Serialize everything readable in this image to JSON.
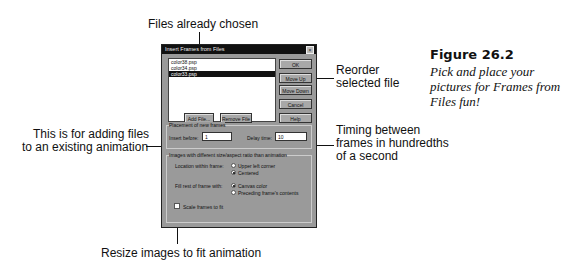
{
  "annotations": {
    "files_chosen": "Files already chosen",
    "reorder": [
      "Reorder",
      "selected file"
    ],
    "adding_files": [
      "This is for adding files",
      "to an existing animation"
    ],
    "timing": [
      "Timing between",
      "frames in hundredths",
      "of a second"
    ],
    "resize": "Resize images to fit animation"
  },
  "figure": {
    "title": "Figure 26.2",
    "caption": "Pick and place your pictures for Frames from Files fun!"
  },
  "dialog": {
    "title": "Insert Frames from Files",
    "close_glyph": "×",
    "files": [
      {
        "name": "color38.psp",
        "selected": false
      },
      {
        "name": "color34.psp",
        "selected": false
      },
      {
        "name": "color33.psp",
        "selected": true
      }
    ],
    "buttons": {
      "ok": "OK",
      "move_up": "Move Up",
      "move_down": "Move Down",
      "cancel": "Cancel",
      "help": "Help",
      "add_file": "Add File...",
      "remove_file": "Remove File"
    },
    "placement": {
      "group_label": "Placement of new frames",
      "insert_before_label": "Insert before:",
      "insert_before_value": "1",
      "delay_label": "Delay time:",
      "delay_value": "10"
    },
    "images": {
      "group_label": "Images with different size/aspect ratio than animation",
      "location_label": "Location within frame:",
      "location_options": [
        "Upper left corner",
        "Centered"
      ],
      "fill_label": "Fill rest of frame with:",
      "fill_options": [
        "Canvas color",
        "Preceding frame's contents"
      ],
      "scale_label": "Scale frames to fit"
    }
  }
}
